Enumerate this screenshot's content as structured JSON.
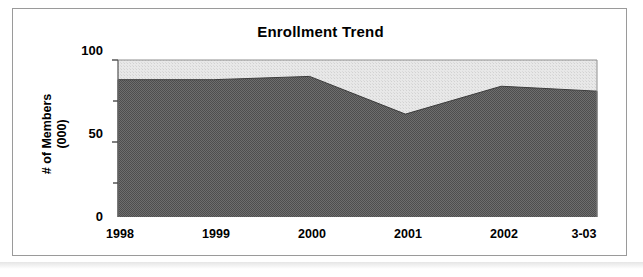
{
  "chart_data": {
    "type": "area",
    "title": "Enrollment Trend",
    "xlabel": "",
    "ylabel": "# of Members\n(000)",
    "categories": [
      "1998",
      "1999",
      "2000",
      "2001",
      "2002",
      "3-03"
    ],
    "series": [
      {
        "name": "# of Members (000)",
        "values": [
          88,
          88,
          90,
          67,
          84,
          81
        ],
        "fill_color": "#5a5a5a"
      }
    ],
    "background_fill": {
      "name": "plot-background",
      "color": "#e4e4e4",
      "top_value": 100
    },
    "ylim": [
      0,
      100
    ],
    "y_ticks": [
      "0",
      "50",
      "100"
    ],
    "y_tick_values": [
      0,
      50,
      100
    ],
    "grid": false,
    "legend": "none",
    "axis_color": "#6b6b6b"
  },
  "figure": {
    "frame_border_color": "#9a9a9a",
    "page_background": "#ffffff"
  }
}
